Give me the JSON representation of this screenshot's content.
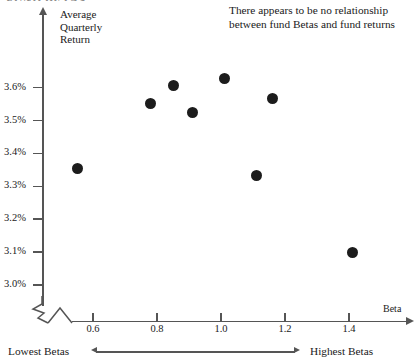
{
  "title_sliver": "FUND BETAS",
  "annotation": {
    "line1": "There appears to be no relationship",
    "line2": "between fund Betas and fund returns"
  },
  "axis_label_stack": {
    "line1": "Average",
    "line2": "Quarterly",
    "line3": "Return"
  },
  "footer": {
    "left_label": "Lowest Betas",
    "right_label": "Highest Betas"
  },
  "chart_data": {
    "type": "scatter",
    "title": "FUND BETAS",
    "xlabel": "Beta",
    "ylabel": "Average Quarterly Return",
    "xlim": [
      0.5,
      1.5
    ],
    "ylim": [
      3.0,
      3.65
    ],
    "grid": false,
    "legend": "none",
    "axis_break_y": true,
    "xticks": [
      "0.6",
      "0.8",
      "1.0",
      "1.2",
      "1.4"
    ],
    "xtick_values": [
      0.6,
      0.8,
      1.0,
      1.2,
      1.4
    ],
    "yticks": [
      "3.0%",
      "3.1%",
      "3.2%",
      "3.3%",
      "3.4%",
      "3.5%",
      "3.6%"
    ],
    "ytick_values": [
      3.0,
      3.1,
      3.2,
      3.3,
      3.4,
      3.5,
      3.6
    ],
    "marker": "filled-circle",
    "marker_color": "#1c1c1c",
    "points": [
      {
        "x": 0.55,
        "y": 3.355
      },
      {
        "x": 0.78,
        "y": 3.553
      },
      {
        "x": 0.85,
        "y": 3.608
      },
      {
        "x": 0.91,
        "y": 3.525
      },
      {
        "x": 1.01,
        "y": 3.628
      },
      {
        "x": 1.11,
        "y": 3.333
      },
      {
        "x": 1.16,
        "y": 3.568
      },
      {
        "x": 1.41,
        "y": 3.1
      }
    ],
    "annotation": "There appears to be no relationship between fund Betas and fund returns"
  },
  "colors": {
    "axis": "#555555",
    "marker": "#1c1c1c",
    "text": "#1a1a1a",
    "background": "#ffffff"
  }
}
